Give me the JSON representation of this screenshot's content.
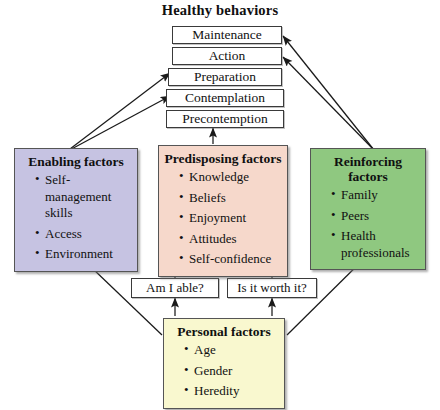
{
  "title": "Healthy behaviors",
  "colors": {
    "enabling": "#c6c3e2",
    "predisposing": "#f6d8cb",
    "reinforcing": "#8fc880",
    "personal": "#f9f8cf",
    "box_border": "#555555",
    "line": "#1a1a1a"
  },
  "stages": [
    {
      "label": "Maintenance"
    },
    {
      "label": "Action"
    },
    {
      "label": "Preparation"
    },
    {
      "label": "Contemplation"
    },
    {
      "label": "Precontemption"
    }
  ],
  "questions": [
    {
      "label": "Am I able?"
    },
    {
      "label": "Is it worth it?"
    }
  ],
  "factors": {
    "enabling": {
      "heading": "Enabling factors",
      "items": [
        "Self-management skills",
        "Access",
        "Environment"
      ]
    },
    "predisposing": {
      "heading": "Predisposing factors",
      "items": [
        "Knowledge",
        "Beliefs",
        "Enjoyment",
        "Attitudes",
        "Self-confidence"
      ]
    },
    "reinforcing": {
      "heading": "Reinforcing factors",
      "items": [
        "Family",
        "Peers",
        "Health professionals"
      ]
    },
    "personal": {
      "heading": "Personal factors",
      "items": [
        "Age",
        "Gender",
        "Heredity"
      ]
    }
  }
}
